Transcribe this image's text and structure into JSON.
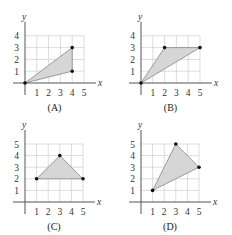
{
  "chart_data": [
    {
      "type": "scatter",
      "label": "(A)",
      "title": "",
      "xlabel": "x",
      "ylabel": "y",
      "xticks": [
        1,
        2,
        3,
        4,
        5
      ],
      "yticks": [
        1,
        2,
        3,
        4
      ],
      "xlim": [
        0,
        5
      ],
      "ylim": [
        0,
        4
      ],
      "grid": true,
      "polygon": [
        [
          0,
          0
        ],
        [
          4,
          3
        ],
        [
          4,
          1
        ]
      ],
      "points": [
        [
          0,
          0
        ],
        [
          4,
          3
        ],
        [
          4,
          1
        ]
      ]
    },
    {
      "type": "scatter",
      "label": "(B)",
      "title": "",
      "xlabel": "x",
      "ylabel": "y",
      "xticks": [
        1,
        2,
        3,
        4,
        5
      ],
      "yticks": [
        1,
        2,
        3,
        4
      ],
      "xlim": [
        0,
        5
      ],
      "ylim": [
        0,
        4
      ],
      "grid": true,
      "polygon": [
        [
          0,
          0
        ],
        [
          2,
          3
        ],
        [
          5,
          3
        ]
      ],
      "points": [
        [
          0,
          0
        ],
        [
          2,
          3
        ],
        [
          5,
          3
        ]
      ]
    },
    {
      "type": "scatter",
      "label": "(C)",
      "title": "",
      "xlabel": "x",
      "ylabel": "y",
      "xticks": [
        1,
        2,
        3,
        4,
        5
      ],
      "yticks": [
        1,
        2,
        3,
        4,
        5
      ],
      "xlim": [
        0,
        5
      ],
      "ylim": [
        0,
        5
      ],
      "grid": true,
      "polygon": [
        [
          1,
          2
        ],
        [
          3,
          4
        ],
        [
          5,
          2
        ]
      ],
      "points": [
        [
          1,
          2
        ],
        [
          3,
          4
        ],
        [
          5,
          2
        ]
      ]
    },
    {
      "type": "scatter",
      "label": "(D)",
      "title": "",
      "xlabel": "x",
      "ylabel": "y",
      "xticks": [
        1,
        2,
        3,
        4,
        5
      ],
      "yticks": [
        1,
        2,
        3,
        4,
        5
      ],
      "xlim": [
        0,
        5
      ],
      "ylim": [
        0,
        5
      ],
      "grid": true,
      "polygon": [
        [
          1,
          1
        ],
        [
          3,
          5
        ],
        [
          5,
          3
        ]
      ],
      "points": [
        [
          1,
          1
        ],
        [
          3,
          5
        ],
        [
          5,
          3
        ]
      ]
    }
  ],
  "layout": [
    {
      "ox": 25,
      "oy": 83,
      "unit": 11.8
    },
    {
      "ox": 141,
      "oy": 83,
      "unit": 11.8
    },
    {
      "ox": 25,
      "oy": 202,
      "unit": 11.6
    },
    {
      "ox": 141,
      "oy": 202,
      "unit": 11.6
    }
  ],
  "colors": {
    "fill": "#d6d6d6",
    "grid": "#cfcfcf",
    "axis": "#555555",
    "point": "#111111"
  }
}
